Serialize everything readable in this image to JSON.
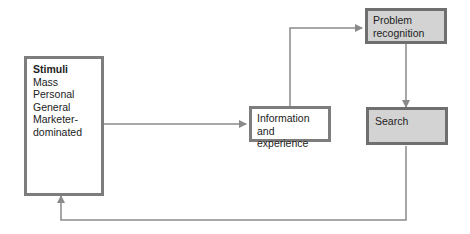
{
  "nodes": {
    "stimuli": {
      "title": "Stimuli",
      "lines": [
        "Mass",
        "Personal",
        "General",
        "Marketer-",
        "dominated"
      ]
    },
    "information": {
      "label_line1": "Information and",
      "label_line2": "experience"
    },
    "problem": {
      "label_line1": "Problem",
      "label_line2": "recognition"
    },
    "search": {
      "label": "Search"
    }
  },
  "edges": [
    {
      "from": "stimuli",
      "to": "information"
    },
    {
      "from": "information",
      "to": "problem"
    },
    {
      "from": "problem",
      "to": "search"
    },
    {
      "from": "search",
      "to": "stimuli"
    }
  ],
  "colors": {
    "line": "#8a8a8a",
    "box_border": "#7d7d7d",
    "shaded_fill": "#d3d3d3"
  }
}
